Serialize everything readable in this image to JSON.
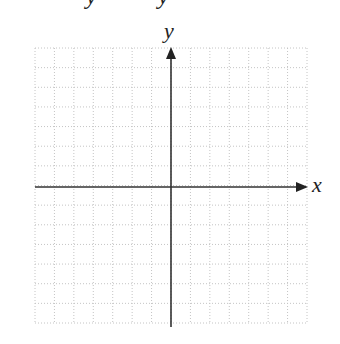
{
  "clipped_header": {
    "glyphs": [
      {
        "text": "y",
        "left": 86
      },
      {
        "text": "y",
        "left": 158
      }
    ]
  },
  "coordinate_plane": {
    "x_axis_label": "x",
    "y_axis_label": "y",
    "grid": {
      "columns": 14,
      "rows": 14,
      "left": 35,
      "top": 48,
      "right": 307,
      "bottom": 323,
      "line_style": "dotted",
      "line_color": "#c4c4c4"
    },
    "axes": {
      "origin_x": 171,
      "origin_y": 187,
      "color": "#333333",
      "x_start": 35,
      "x_end": 308,
      "y_start": 327,
      "y_end": 47
    }
  }
}
